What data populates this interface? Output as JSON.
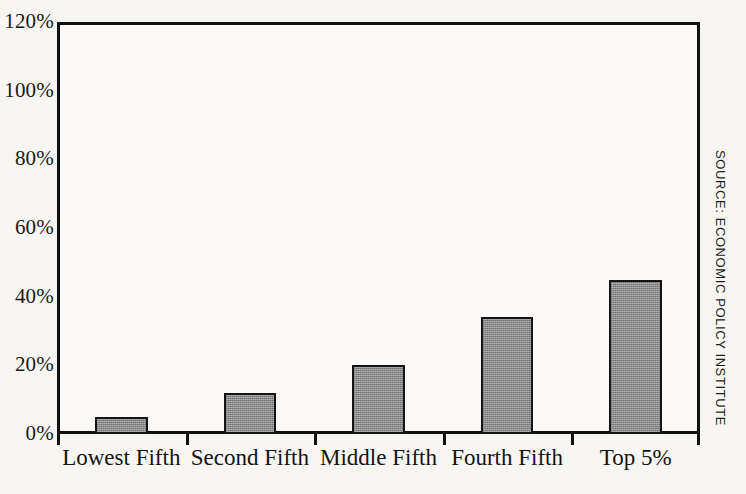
{
  "chart_data": {
    "type": "bar",
    "title": "",
    "subtitle": "",
    "xlabel": "",
    "ylabel": "",
    "categories": [
      "Lowest Fifth",
      "Second Fifth",
      "Middle Fifth",
      "Fourth Fifth",
      "Top 5%"
    ],
    "values": [
      5,
      12,
      20,
      34,
      45
    ],
    "value_unit": "%",
    "ylim": [
      0,
      120
    ],
    "ytick_values": [
      0,
      20,
      40,
      60,
      80,
      100,
      120
    ],
    "ytick_labels": [
      "0%",
      "20%",
      "40%",
      "60%",
      "80%",
      "100%",
      "120%"
    ],
    "grid": false,
    "legend": null,
    "legend_position": "none",
    "annotations": [
      "SOURCE: ECONOMIC POLICY INSTITUTE"
    ],
    "bar_color": "#8a8a8a",
    "bar_border_color": "#141414",
    "axis_color": "#111111",
    "background_color": "#f7f6f3",
    "plot_background_color": "#fbfaf8"
  },
  "axes": {
    "y_ticks": [
      {
        "label": "120%",
        "value": 120
      },
      {
        "label": "100%",
        "value": 100
      },
      {
        "label": "80%",
        "value": 80
      },
      {
        "label": "60%",
        "value": 60
      },
      {
        "label": "40%",
        "value": 40
      },
      {
        "label": "20%",
        "value": 20
      },
      {
        "label": "0%",
        "value": 0
      }
    ],
    "x_categories": [
      {
        "label": "Lowest Fifth",
        "value": 5
      },
      {
        "label": "Second Fifth",
        "value": 12
      },
      {
        "label": "Middle Fifth",
        "value": 20
      },
      {
        "label": "Fourth Fifth",
        "value": 34
      },
      {
        "label": "Top 5%",
        "value": 45
      }
    ]
  },
  "source": {
    "text": "SOURCE: ECONOMIC POLICY INSTITUTE"
  }
}
